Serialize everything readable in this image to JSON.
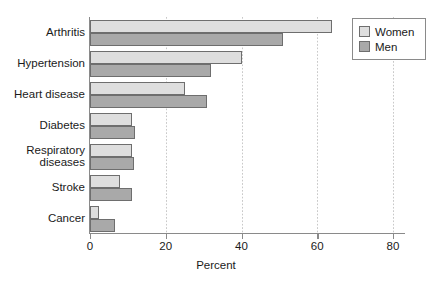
{
  "chart_data": {
    "type": "bar",
    "orientation": "horizontal",
    "title": "",
    "xlabel": "Percent",
    "ylabel": "",
    "xlim": [
      0,
      86
    ],
    "xticks": [
      0,
      20,
      40,
      60,
      80
    ],
    "xtick_labels": [
      "0",
      "20",
      "40",
      "60",
      "80"
    ],
    "grid": "vertical-dotted",
    "legend_position": "top-right",
    "categories": [
      "Arthritis",
      "Hypertension",
      "Heart disease",
      "Diabetes",
      "Respiratory\ndiseases",
      "Stroke",
      "Cancer"
    ],
    "series": [
      {
        "name": "Women",
        "color": "#dedede",
        "values": [
          64,
          40,
          25,
          11,
          11,
          8,
          2.5
        ]
      },
      {
        "name": "Men",
        "color": "#a9a9a9",
        "values": [
          51,
          32,
          31,
          12,
          11.5,
          11,
          6.5
        ]
      }
    ]
  },
  "legend": {
    "items": [
      {
        "label": "Women"
      },
      {
        "label": "Men"
      }
    ]
  }
}
